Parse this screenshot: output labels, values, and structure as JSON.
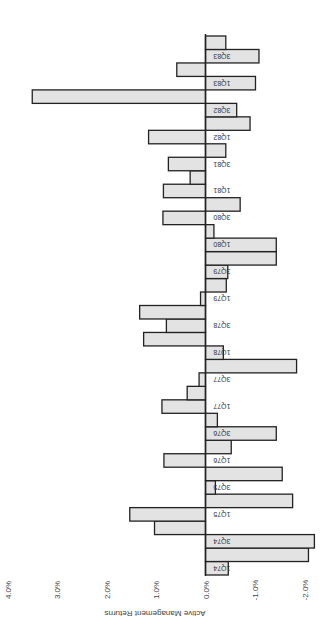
{
  "chart_data": {
    "type": "bar",
    "orientation": "rotated-horizontal",
    "title": "",
    "xlabel": "",
    "ylabel": "Active Management Returns",
    "ylim": [
      -2.0,
      4.0
    ],
    "yticks": [
      "4.0%",
      "3.0%",
      "2.0%",
      "1.0%",
      "0.0%",
      "-1.0%",
      "-2.0%"
    ],
    "ytick_values": [
      4.0,
      3.0,
      2.0,
      1.0,
      0.0,
      -1.0,
      -2.0
    ],
    "grid": false,
    "labeled_categories": [
      "1Q74",
      "3Q74",
      "1Q75",
      "3Q75",
      "1Q76",
      "3Q76",
      "1Q77",
      "3Q77",
      "1Q78",
      "3Q78",
      "1Q79",
      "3Q79",
      "1Q80",
      "3Q80",
      "1Q81",
      "3Q81",
      "1Q82",
      "3Q82",
      "1Q83",
      "3Q83"
    ],
    "categories": [
      "1Q74",
      "2Q74",
      "3Q74",
      "4Q74",
      "1Q75",
      "2Q75",
      "3Q75",
      "4Q75",
      "1Q76",
      "2Q76",
      "3Q76",
      "4Q76",
      "1Q77",
      "2Q77",
      "3Q77",
      "4Q77",
      "1Q78",
      "2Q78",
      "3Q78",
      "4Q78",
      "1Q79",
      "2Q79",
      "3Q79",
      "4Q79",
      "1Q80",
      "2Q80",
      "3Q80",
      "4Q80",
      "1Q81",
      "2Q81",
      "3Q81",
      "4Q81",
      "1Q82",
      "2Q82",
      "3Q82",
      "4Q82",
      "1Q83",
      "2Q83",
      "3Q83",
      "4Q83"
    ],
    "values": [
      -0.46,
      -2.08,
      -2.2,
      1.03,
      1.53,
      -1.76,
      -0.2,
      -1.55,
      0.84,
      -0.52,
      -1.43,
      -0.24,
      0.88,
      0.37,
      0.13,
      -1.84,
      -0.36,
      1.25,
      0.79,
      1.33,
      0.1,
      -0.42,
      -0.45,
      -1.43,
      -1.43,
      -0.17,
      0.86,
      -0.7,
      0.85,
      0.31,
      0.75,
      -0.41,
      1.15,
      -0.9,
      -0.63,
      3.5,
      -1.01,
      0.58,
      -1.08,
      -0.41
    ],
    "colors": {
      "bar_fill": "#e3e3e3",
      "bar_stroke": "#222222"
    }
  }
}
